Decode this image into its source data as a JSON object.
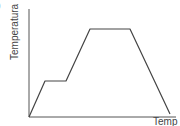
{
  "corner_mark": ")",
  "axes": {
    "ylabel": "Temperatura",
    "xlabel": "Temp"
  },
  "colors": {
    "line": "#444444",
    "axis": "#555555"
  },
  "chart_data": {
    "type": "line",
    "title": "",
    "xlabel": "Tempo",
    "ylabel": "Temperatura",
    "grid": false,
    "legend": null,
    "ticks": false,
    "series": [
      {
        "name": "Temperatura",
        "points": [
          {
            "x": 0,
            "y": 0
          },
          {
            "x": 16,
            "y": 36
          },
          {
            "x": 37,
            "y": 36
          },
          {
            "x": 61,
            "y": 88
          },
          {
            "x": 101,
            "y": 88
          },
          {
            "x": 141,
            "y": 3
          }
        ]
      }
    ],
    "xlim": [
      0,
      146
    ],
    "ylim": [
      0,
      107
    ],
    "annotations": [
      "heating",
      "plateau (phase change)",
      "heating",
      "plateau (phase change)",
      "cooling"
    ]
  }
}
